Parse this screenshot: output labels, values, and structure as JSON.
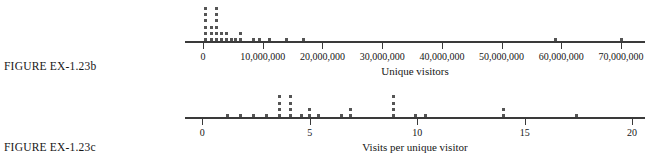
{
  "figures": [
    {
      "caption": "FIGURE EX-1.23b",
      "axis_title": "Unique visitors",
      "chart_index": 0
    },
    {
      "caption": "FIGURE EX-1.23c",
      "axis_title": "Visits per unique visitor",
      "chart_index": 1
    }
  ],
  "chart_data": [
    {
      "type": "scatter",
      "plot_style": "dotplot",
      "title": "",
      "xlabel": "Unique visitors",
      "ylabel": "",
      "xlim": [
        -3000000,
        74000000
      ],
      "grid": false,
      "legend": null,
      "tick_labels": [
        "0",
        "10,000,000",
        "20,000,000",
        "30,000,000",
        "40,000,000",
        "50,000,000",
        "60,000,000",
        "70,000,000"
      ],
      "tick_values": [
        0,
        10000000,
        20000000,
        30000000,
        40000000,
        50000000,
        60000000,
        70000000
      ],
      "stacks": [
        {
          "x": 500000,
          "count": 6
        },
        {
          "x": 1500000,
          "count": 3
        },
        {
          "x": 2300000,
          "count": 6
        },
        {
          "x": 3100000,
          "count": 2
        },
        {
          "x": 3900000,
          "count": 2
        },
        {
          "x": 4700000,
          "count": 1
        },
        {
          "x": 5500000,
          "count": 1
        },
        {
          "x": 6300000,
          "count": 2
        },
        {
          "x": 8500000,
          "count": 1
        },
        {
          "x": 9400000,
          "count": 1
        },
        {
          "x": 11200000,
          "count": 1
        },
        {
          "x": 14000000,
          "count": 1
        },
        {
          "x": 16800000,
          "count": 1
        },
        {
          "x": 59000000,
          "count": 1
        },
        {
          "x": 70000000,
          "count": 1
        }
      ],
      "values": [
        500000,
        500000,
        500000,
        500000,
        500000,
        500000,
        1500000,
        1500000,
        1500000,
        2300000,
        2300000,
        2300000,
        2300000,
        2300000,
        2300000,
        3100000,
        3100000,
        3900000,
        3900000,
        4700000,
        5500000,
        6300000,
        6300000,
        8500000,
        9400000,
        11200000,
        14000000,
        16800000,
        59000000,
        70000000
      ]
    },
    {
      "type": "scatter",
      "plot_style": "dotplot",
      "title": "",
      "xlabel": "Visits per unique visitor",
      "ylabel": "",
      "xlim": [
        -0.8,
        20.6
      ],
      "grid": false,
      "legend": null,
      "tick_labels": [
        "0",
        "5",
        "10",
        "15",
        "20"
      ],
      "tick_values": [
        0,
        5,
        10,
        15,
        20
      ],
      "stacks": [
        {
          "x": 1.2,
          "count": 1
        },
        {
          "x": 1.8,
          "count": 1
        },
        {
          "x": 2.4,
          "count": 1
        },
        {
          "x": 3.0,
          "count": 1
        },
        {
          "x": 3.6,
          "count": 4
        },
        {
          "x": 4.1,
          "count": 4
        },
        {
          "x": 4.6,
          "count": 1
        },
        {
          "x": 5.0,
          "count": 2
        },
        {
          "x": 5.4,
          "count": 1
        },
        {
          "x": 6.5,
          "count": 1
        },
        {
          "x": 6.9,
          "count": 2
        },
        {
          "x": 8.9,
          "count": 4
        },
        {
          "x": 9.9,
          "count": 1
        },
        {
          "x": 10.4,
          "count": 1
        },
        {
          "x": 14.0,
          "count": 2
        },
        {
          "x": 17.4,
          "count": 1
        }
      ],
      "values": [
        1.2,
        1.8,
        2.4,
        3.0,
        3.6,
        3.6,
        3.6,
        3.6,
        4.1,
        4.1,
        4.1,
        4.1,
        4.6,
        5.0,
        5.0,
        5.4,
        6.5,
        6.9,
        6.9,
        8.9,
        8.9,
        8.9,
        8.9,
        9.9,
        10.4,
        14.0,
        14.0,
        17.4
      ]
    }
  ]
}
